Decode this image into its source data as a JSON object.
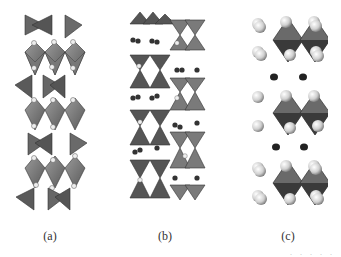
{
  "figure": {
    "panels": [
      {
        "id": "a",
        "label": "(a)",
        "description": "layered structure with octahedra and tetrahedra chains, small white atoms"
      },
      {
        "id": "b",
        "label": "(b)",
        "description": "staggered bow-tie tetrahedra with dark interlayer atoms"
      },
      {
        "id": "c",
        "label": "(c)",
        "description": "octahedral layers with large spheres separated by dark atoms"
      }
    ],
    "footer_fragment": ". . . . ."
  },
  "colors": {
    "polyhedron": "#7a7a7a",
    "polyhedron_dark": "#4a4a4a",
    "atom_light": "#e6e6e6",
    "atom_dark": "#2a2a2a"
  }
}
